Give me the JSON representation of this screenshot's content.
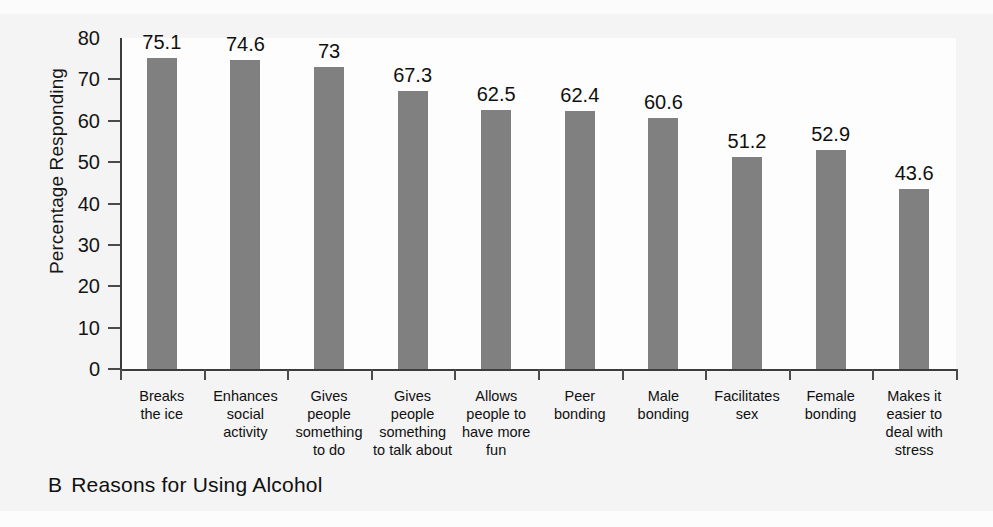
{
  "figure": {
    "caption_letter": "B",
    "caption_text": "Reasons for Using Alcohol",
    "bar_color": "#808080",
    "axis_color": "#3c3c3c",
    "text_color": "#101010",
    "background": "#fefefe"
  },
  "chart_data": {
    "type": "bar",
    "xlabel": "",
    "ylabel": "Percentage Responding",
    "ylim": [
      0,
      80
    ],
    "yticks": [
      0,
      10,
      20,
      30,
      40,
      50,
      60,
      70,
      80
    ],
    "ytick_labels": [
      "0",
      "10",
      "20",
      "30",
      "40",
      "50",
      "60",
      "70",
      "80"
    ],
    "grid": false,
    "legend": null,
    "categories": [
      "Breaks the ice",
      "Enhances social activity",
      "Gives people something to do",
      "Gives people something to talk about",
      "Allows people to have more fun",
      "Peer bonding",
      "Male bonding",
      "Facilitates sex",
      "Female bonding",
      "Makes it easier to deal with stress"
    ],
    "category_lines": [
      [
        "Breaks",
        "the ice"
      ],
      [
        "Enhances",
        "social",
        "activity"
      ],
      [
        "Gives",
        "people",
        "something",
        "to do"
      ],
      [
        "Gives",
        "people",
        "something",
        "to talk about"
      ],
      [
        "Allows",
        "people to",
        "have more",
        "fun"
      ],
      [
        "Peer",
        "bonding"
      ],
      [
        "Male",
        "bonding"
      ],
      [
        "Facilitates",
        "sex"
      ],
      [
        "Female",
        "bonding"
      ],
      [
        "Makes it",
        "easier to",
        "deal with",
        "stress"
      ]
    ],
    "values": [
      75.1,
      74.6,
      73,
      67.3,
      62.5,
      62.4,
      60.6,
      51.2,
      52.9,
      43.6
    ],
    "value_labels": [
      "75.1",
      "74.6",
      "73",
      "67.3",
      "62.5",
      "62.4",
      "60.6",
      "51.2",
      "52.9",
      "43.6"
    ]
  }
}
